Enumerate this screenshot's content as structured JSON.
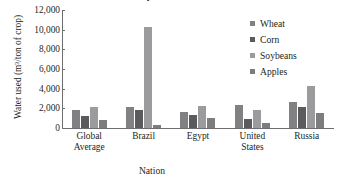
{
  "title": {
    "text": "Water Use for Various Crops",
    "note": "cropped at top edge of screenshot"
  },
  "chart_data": {
    "type": "bar",
    "title": "Water Use for Various Crops",
    "xlabel": "Nation",
    "ylabel": "Water used (m³/ton of crop)",
    "categories": [
      "Global Average",
      "Brazil",
      "Egypt",
      "United States",
      "Russia"
    ],
    "series": [
      {
        "name": "Wheat",
        "color": "#818083",
        "values": [
          1800,
          2100,
          1600,
          2300,
          2600
        ]
      },
      {
        "name": "Corn",
        "color": "#5b5a5d",
        "values": [
          1200,
          1800,
          1350,
          900,
          2100
        ]
      },
      {
        "name": "Soybeans",
        "color": "#9b9a9d",
        "values": [
          2100,
          10300,
          2250,
          1800,
          4300
        ]
      },
      {
        "name": "Apples",
        "color": "#7d7c7f",
        "values": [
          800,
          300,
          1000,
          550,
          1500
        ]
      }
    ],
    "ylim": [
      0,
      12000
    ],
    "ytick_labels": [
      "12,000",
      "10,000",
      "8,000",
      "6,000",
      "4,000",
      "2,000",
      "0"
    ],
    "ytick_values": [
      12000,
      10000,
      8000,
      6000,
      4000,
      2000,
      0
    ],
    "grid": false,
    "legend_position": "right"
  },
  "axis": {
    "x_title": "Nation",
    "y_title": "Water used (m³/ton of crop)"
  },
  "legend": {
    "items": [
      {
        "label": "Wheat",
        "color": "#818083"
      },
      {
        "label": "Corn",
        "color": "#5b5a5d"
      },
      {
        "label": "Soybeans",
        "color": "#9b9a9d"
      },
      {
        "label": "Apples",
        "color": "#7d7c7f"
      }
    ]
  },
  "colors": {
    "axis": "#6d6e71",
    "text": "#231f20",
    "background": "#ffffff"
  }
}
